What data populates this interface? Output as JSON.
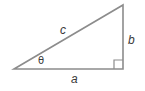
{
  "diagram": {
    "type": "right-triangle",
    "stroke_color": "#8c8c8c",
    "text_color": "#3a3a3a",
    "vertices": {
      "left": [
        14,
        69
      ],
      "right_angle": [
        123,
        69
      ],
      "top": [
        123,
        5
      ]
    },
    "labels": {
      "hypotenuse": "c",
      "opposite": "b",
      "adjacent": "a",
      "angle": "θ"
    },
    "right_angle_marker": true
  }
}
